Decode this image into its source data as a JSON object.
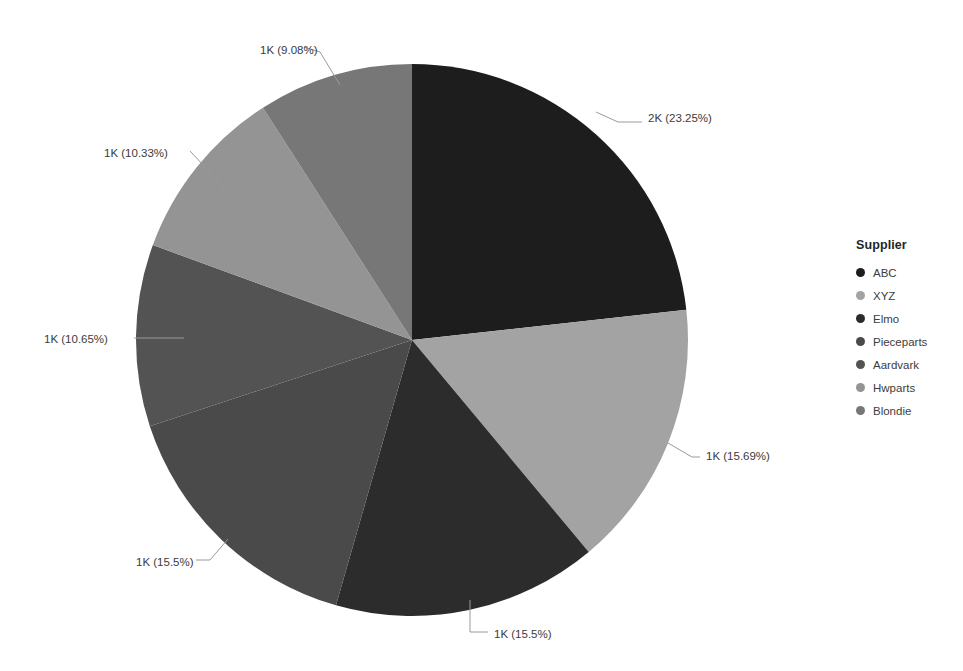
{
  "legend": {
    "title": "Supplier",
    "position": "right"
  },
  "chart_data": {
    "type": "pie",
    "title": "",
    "xlabel": "",
    "ylabel": "",
    "legend_title": "Supplier",
    "legend_position": "right",
    "grid": false,
    "start_angle_deg": 0,
    "direction": "clockwise",
    "categories": [
      "ABC",
      "XYZ",
      "Elmo",
      "Pieceparts",
      "Aardvark",
      "Hwparts",
      "Blondie"
    ],
    "values": [
      23.25,
      15.69,
      15.5,
      15.5,
      10.65,
      10.33,
      9.08
    ],
    "value_unit": "percent",
    "slices": [
      {
        "name": "ABC",
        "percent": 23.25,
        "label": "2K (23.25%)",
        "value_text": "2K",
        "percent_text": "23.25%",
        "color": "#1d1d1d",
        "label_x": 648,
        "label_y": 122,
        "leader": "596,112 618,122 642,122"
      },
      {
        "name": "XYZ",
        "percent": 15.69,
        "label": "1K (15.69%)",
        "value_text": "1K",
        "percent_text": "15.69%",
        "color": "#a3a3a3",
        "label_x": 706,
        "label_y": 460,
        "leader": "668,443 692,457 700,457"
      },
      {
        "name": "Elmo",
        "percent": 15.5,
        "label": "1K (15.5%)",
        "value_text": "1K",
        "percent_text": "15.5%",
        "color": "#2c2c2c",
        "label_x": 494,
        "label_y": 638,
        "leader": "470,600 470,632 488,632"
      },
      {
        "name": "Pieceparts",
        "percent": 15.5,
        "label": "1K (15.5%)",
        "value_text": "1K",
        "percent_text": "15.5%",
        "color": "#4a4a4a",
        "label_x": 136,
        "label_y": 566,
        "leader": "228,539 210,560 196,560"
      },
      {
        "name": "Aardvark",
        "percent": 10.65,
        "label": "1K (10.65%)",
        "value_text": "1K",
        "percent_text": "10.65%",
        "color": "#535353",
        "label_x": 44,
        "label_y": 343,
        "leader": "184,338 150,338 134,338"
      },
      {
        "name": "Hwparts",
        "percent": 10.33,
        "label": "1K (10.33%)",
        "value_text": "1K",
        "percent_text": "10.33%",
        "color": "#949494",
        "label_x": 104,
        "label_y": 157,
        "leader": "224,189 204,166 190,151"
      },
      {
        "name": "Blondie",
        "percent": 9.08,
        "label": "1K (9.08%)",
        "value_text": "1K",
        "percent_text": "9.08%",
        "color": "#777777",
        "label_x": 260,
        "label_y": 54,
        "leader": "340,85 320,52 304,47"
      }
    ],
    "center_x": 412,
    "center_y": 340,
    "radius": 276
  }
}
